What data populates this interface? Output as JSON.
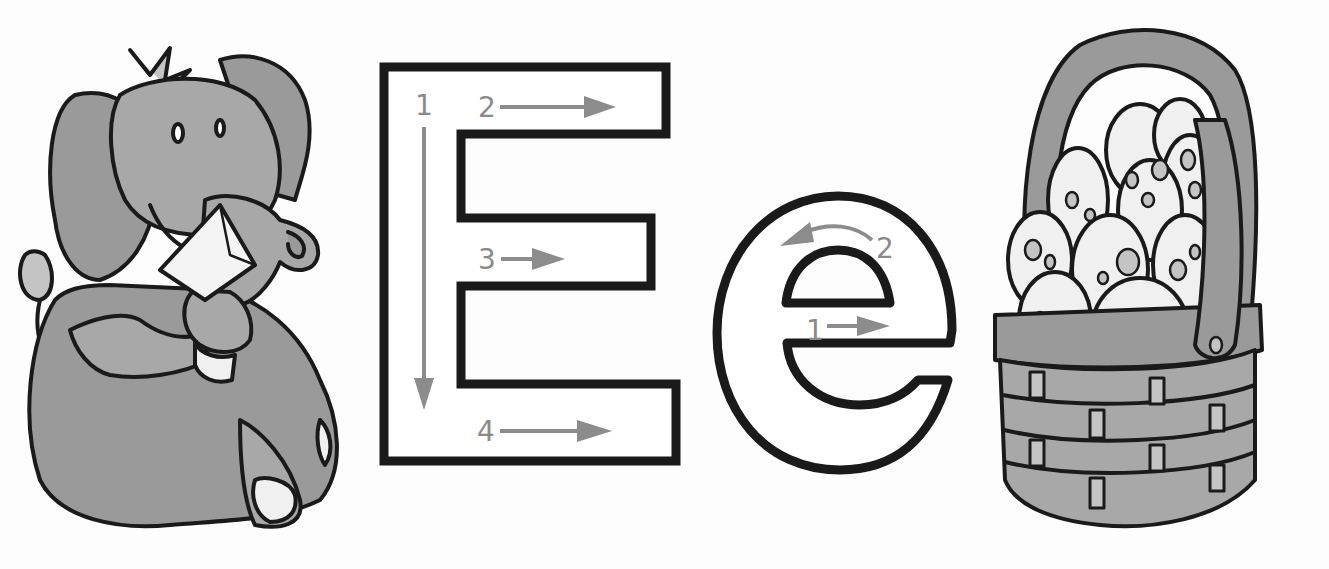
{
  "worksheet": {
    "letter_upper": "E",
    "letter_lower": "e",
    "colors": {
      "outline": "#1a1a1a",
      "arrow": "#8c8c8c",
      "fill_gray": "#9a9a9a",
      "fill_light": "#c4c4c4",
      "egg": "#f0f0f0"
    },
    "upper_strokes": [
      {
        "number": "1",
        "direction": "down"
      },
      {
        "number": "2",
        "direction": "right"
      },
      {
        "number": "3",
        "direction": "right"
      },
      {
        "number": "4",
        "direction": "right"
      }
    ],
    "lower_strokes": [
      {
        "number": "1",
        "direction": "right"
      },
      {
        "number": "2",
        "direction": "curve-left"
      }
    ],
    "illustrations": {
      "left": "elephant",
      "right": "egg-basket"
    }
  }
}
